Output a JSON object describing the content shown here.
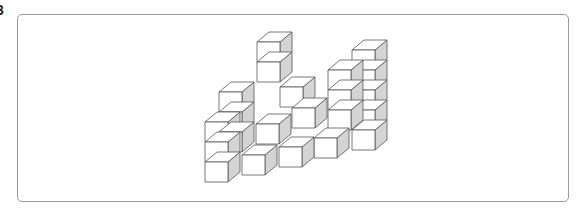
{
  "problem": {
    "number": "3"
  },
  "figure": {
    "cube": {
      "w": 23,
      "h": 20,
      "dx": 12,
      "dy": -10
    },
    "colors": {
      "front": "#ffffff",
      "top": "#ffffff",
      "side": "#d4d4d4",
      "edge": "#555555",
      "frame": "#9a9a9a"
    },
    "cubes": [
      {
        "x": 257,
        "y": 62
      },
      {
        "x": 257,
        "y": 42
      },
      {
        "x": 352,
        "y": 130
      },
      {
        "x": 352,
        "y": 110
      },
      {
        "x": 352,
        "y": 90
      },
      {
        "x": 352,
        "y": 70
      },
      {
        "x": 352,
        "y": 50
      },
      {
        "x": 328,
        "y": 110
      },
      {
        "x": 328,
        "y": 90
      },
      {
        "x": 328,
        "y": 70
      },
      {
        "x": 280,
        "y": 87
      },
      {
        "x": 219,
        "y": 92
      },
      {
        "x": 219,
        "y": 112
      },
      {
        "x": 219,
        "y": 132
      },
      {
        "x": 292,
        "y": 108
      },
      {
        "x": 256,
        "y": 124
      },
      {
        "x": 314,
        "y": 138
      },
      {
        "x": 279,
        "y": 147
      },
      {
        "x": 242,
        "y": 155
      },
      {
        "x": 205,
        "y": 162
      },
      {
        "x": 205,
        "y": 142
      },
      {
        "x": 205,
        "y": 122
      }
    ]
  }
}
